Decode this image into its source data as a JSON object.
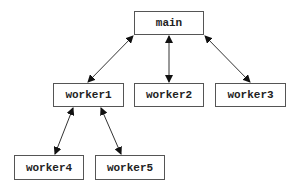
{
  "diagram": {
    "type": "tree",
    "colors": {
      "box_border": "#555555",
      "text": "#222222",
      "edge": "#333333",
      "background": "#ffffff"
    },
    "nodes": [
      {
        "id": "main",
        "label": "main",
        "x": 134,
        "y": 11,
        "w": 70,
        "h": 24
      },
      {
        "id": "worker1",
        "label": "worker1",
        "x": 53,
        "y": 83,
        "w": 71,
        "h": 24
      },
      {
        "id": "worker2",
        "label": "worker2",
        "x": 134,
        "y": 83,
        "w": 70,
        "h": 24
      },
      {
        "id": "worker3",
        "label": "worker3",
        "x": 215,
        "y": 83,
        "w": 71,
        "h": 24
      },
      {
        "id": "worker4",
        "label": "worker4",
        "x": 14,
        "y": 155,
        "w": 70,
        "h": 25
      },
      {
        "id": "worker5",
        "label": "worker5",
        "x": 95,
        "y": 155,
        "w": 70,
        "h": 25
      }
    ],
    "edges": [
      {
        "from": "main",
        "to": "worker1",
        "bidirectional": true
      },
      {
        "from": "main",
        "to": "worker2",
        "bidirectional": true
      },
      {
        "from": "main",
        "to": "worker3",
        "bidirectional": true
      },
      {
        "from": "worker1",
        "to": "worker4",
        "bidirectional": true
      },
      {
        "from": "worker1",
        "to": "worker5",
        "bidirectional": true
      }
    ]
  }
}
